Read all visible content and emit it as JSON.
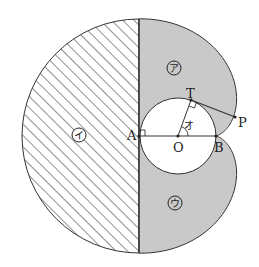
{
  "diagram": {
    "type": "geometry",
    "colors": {
      "shade": "#c9c9c9",
      "line": "#333333",
      "hatch": "#555555",
      "background": "#ffffff"
    },
    "points": {
      "A": {
        "label": "A",
        "x": 139,
        "y": 136
      },
      "O": {
        "label": "O",
        "x": 178,
        "y": 136
      },
      "B": {
        "label": "B",
        "x": 216,
        "y": 136
      },
      "T": {
        "label": "T",
        "x": 191,
        "y": 101
      },
      "P": {
        "label": "P",
        "x": 235,
        "y": 117
      }
    },
    "inner_circle": {
      "cx": 178,
      "cy": 136,
      "r": 38
    },
    "outer_semicircle": {
      "cx": 139,
      "cy": 136,
      "r": 117
    },
    "regions": {
      "a": {
        "label": "ア",
        "x": 174,
        "y": 68
      },
      "i": {
        "label": "イ",
        "x": 79,
        "y": 135
      },
      "u": {
        "label": "ウ",
        "x": 175,
        "y": 203
      }
    },
    "angle_label": {
      "label": "オ",
      "x": 188,
      "y": 125
    },
    "right_angle_marks": [
      "A",
      "T"
    ]
  }
}
